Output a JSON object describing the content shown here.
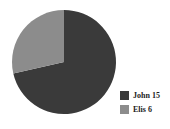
{
  "background_color": "#ffffff",
  "chart_data": {
    "type": "pie",
    "title": "",
    "labels": [
      "John",
      "Elis"
    ],
    "categories": [
      "John 15",
      "Elis 6"
    ],
    "values": [
      15,
      6
    ],
    "total": 21,
    "percentages": [
      71.4,
      28.6
    ],
    "colors": [
      "#3a3a3a",
      "#8c8c8c"
    ],
    "start_angle_deg": 0,
    "direction": "clockwise",
    "grid": false,
    "legend_position": "bottom-right",
    "slices": [
      {
        "label": "John 15",
        "name": "John",
        "value": 15,
        "percent": 71.4,
        "sweep_deg": 257.1,
        "color": "#3a3a3a"
      },
      {
        "label": "Elis 6",
        "name": "Elis",
        "value": 6,
        "percent": 28.6,
        "sweep_deg": 102.9,
        "color": "#8c8c8c"
      }
    ],
    "geometry": {
      "center_x": 64,
      "center_y": 62,
      "radius": 52
    }
  },
  "legend": {
    "items": [
      {
        "label": "John 15",
        "color": "#3a3a3a",
        "swatch_name": "legend-swatch-john"
      },
      {
        "label": "Elis 6",
        "color": "#8c8c8c",
        "swatch_name": "legend-swatch-elis"
      }
    ]
  }
}
